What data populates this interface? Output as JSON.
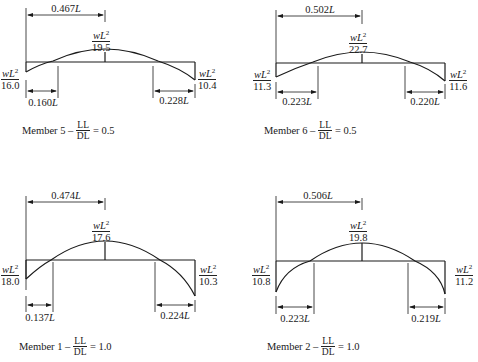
{
  "diagram": {
    "type": "moment-diagrams",
    "panels": [
      {
        "member": "Member 5",
        "caption_prefix": "Member 5 –",
        "ratio_num": "LL",
        "ratio_den": "DL",
        "ratio_value": "= 0.5",
        "max_positive_distance": "0.467",
        "max_positive": {
          "num": "wL",
          "den": "19.5"
        },
        "left_moment": {
          "num": "wL",
          "den": "16.0"
        },
        "right_moment": {
          "num": "wL",
          "den": "10.4"
        },
        "left_inflection": "0.160",
        "right_inflection": "0.228"
      },
      {
        "member": "Member 6",
        "caption_prefix": "Member 6 –",
        "ratio_num": "LL",
        "ratio_den": "DL",
        "ratio_value": "= 0.5",
        "max_positive_distance": "0.502",
        "max_positive": {
          "num": "wL",
          "den": "22.7"
        },
        "left_moment": {
          "num": "wL",
          "den": "11.3"
        },
        "right_moment": {
          "num": "wL",
          "den": "11.6"
        },
        "left_inflection": "0.223",
        "right_inflection": "0.220"
      },
      {
        "member": "Member 1",
        "caption_prefix": "Member 1 –",
        "ratio_num": "LL",
        "ratio_den": "DL",
        "ratio_value": "= 1.0",
        "max_positive_distance": "0.474",
        "max_positive": {
          "num": "wL",
          "den": "17.6"
        },
        "left_moment": {
          "num": "wL",
          "den": "18.0"
        },
        "right_moment": {
          "num": "wL",
          "den": "10.3"
        },
        "left_inflection": "0.137",
        "right_inflection": "0.224"
      },
      {
        "member": "Member 2",
        "caption_prefix": "Member 2 –",
        "ratio_num": "LL",
        "ratio_den": "DL",
        "ratio_value": "= 1.0",
        "max_positive_distance": "0.506",
        "max_positive": {
          "num": "wL",
          "den": "19.8"
        },
        "left_moment": {
          "num": "wL",
          "den": "10.8"
        },
        "right_moment": {
          "num": "wL",
          "den": "11.2"
        },
        "left_inflection": "0.223",
        "right_inflection": "0.219"
      }
    ],
    "length_symbol": "L",
    "exponent": "2"
  }
}
